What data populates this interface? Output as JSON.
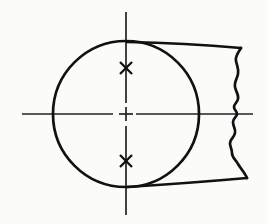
{
  "drawing": {
    "title": "Partial circular end view with break line",
    "canvas": {
      "width": 268,
      "height": 224,
      "background": "#fbfbf9"
    },
    "stroke_color": "#111111",
    "centerline_color": "#222222",
    "circle": {
      "label": "main-circle",
      "cx": 126,
      "cy": 114,
      "r": 73,
      "stroke_width": 2.6
    },
    "center_mark": {
      "label": "center-cross",
      "x": 126,
      "y": 114
    },
    "horizontal_centerline": {
      "label": "horizontal-centerline",
      "x1": 22,
      "x2": 253,
      "y": 114,
      "stroke_width": 1.6,
      "dash": "none"
    },
    "vertical_centerline": {
      "label": "vertical-centerline",
      "x": 126,
      "y1": 12,
      "y2": 215,
      "stroke_width": 1.6,
      "dash": "none"
    },
    "cross_marks": [
      {
        "label": "upper-x-mark",
        "cx": 126,
        "cy": 68,
        "size": 9
      },
      {
        "label": "lower-x-mark",
        "cx": 126,
        "cy": 161,
        "size": 9
      }
    ],
    "tangent_lines": [
      {
        "label": "upper-tangent",
        "x1": 127,
        "y1": 42,
        "x2": 241,
        "y2": 48
      },
      {
        "label": "lower-tangent",
        "x1": 127,
        "y1": 187,
        "x2": 247,
        "y2": 178
      }
    ],
    "break_line": {
      "label": "freehand-break-line",
      "description": "wavy vertical break edge on right side",
      "points": "241,48 236,60 238,72 235,84 238,96 234,104 237,112 233,120 236,130 230,140 232,150 237,160 243,170 247,178"
    }
  }
}
